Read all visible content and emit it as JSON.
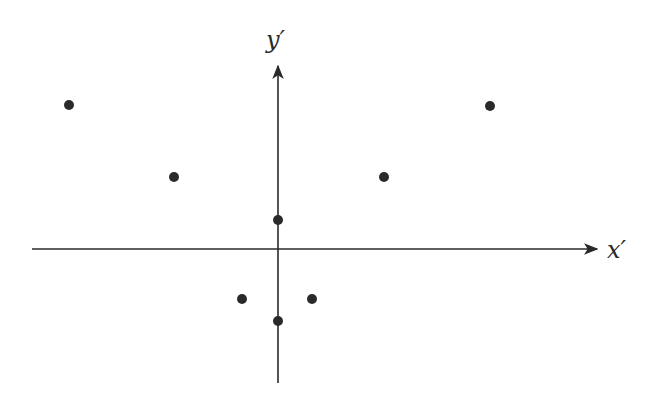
{
  "figure": {
    "x_axis_label": "x′",
    "y_axis_label": "y′",
    "ink_color": "#2a2a2a",
    "background": "#ffffff",
    "origin_px": [
      278,
      249
    ],
    "x_axis_px": {
      "start": 32,
      "end": 597
    },
    "y_axis_px": {
      "top": 66,
      "bottom": 383
    },
    "dot_radius_px": 5
  },
  "chart_data": {
    "type": "scatter",
    "title": "",
    "xlabel": "x′",
    "ylabel": "y′",
    "grid": false,
    "ticks": false,
    "units_note": "approximate, 1 unit ≈ 35 px",
    "points": [
      {
        "x": -6,
        "y": 4.1,
        "px": [
          69,
          105
        ]
      },
      {
        "x": 6,
        "y": 4.1,
        "px": [
          490,
          106
        ]
      },
      {
        "x": -3,
        "y": 2.06,
        "px": [
          174,
          177
        ]
      },
      {
        "x": 3,
        "y": 2.06,
        "px": [
          384,
          177
        ]
      },
      {
        "x": 0,
        "y": 0.83,
        "px": [
          278,
          220
        ]
      },
      {
        "x": -1,
        "y": -1.43,
        "px": [
          242,
          299
        ]
      },
      {
        "x": 1,
        "y": -1.43,
        "px": [
          312,
          299
        ]
      },
      {
        "x": 0,
        "y": -2.06,
        "px": [
          278,
          321
        ]
      }
    ]
  }
}
